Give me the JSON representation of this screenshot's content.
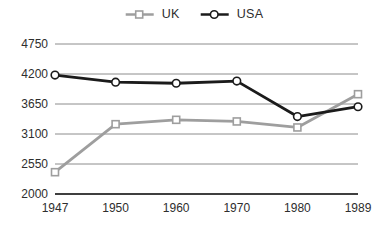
{
  "chart_data": {
    "type": "line",
    "title": "",
    "xlabel": "",
    "ylabel": "",
    "categories": [
      "1947",
      "1950",
      "1960",
      "1970",
      "1980",
      "1989"
    ],
    "series": [
      {
        "name": "UK",
        "color": "#9e9e9e",
        "marker": "square",
        "values": [
          2400,
          3280,
          3360,
          3330,
          3220,
          3830
        ]
      },
      {
        "name": "USA",
        "color": "#1b1b1b",
        "marker": "circle",
        "values": [
          4180,
          4050,
          4030,
          4070,
          3420,
          3600
        ]
      }
    ],
    "ylim": [
      2000,
      4750
    ],
    "yticks": [
      4750,
      4200,
      3650,
      3100,
      2550,
      2000
    ],
    "grid": true,
    "legend_position": "top-center",
    "colors": {
      "gridline": "#8c8c8c",
      "axis_line": "#3f3f3f",
      "tick_text": "#2e2e2e",
      "marker_fill": "#ffffff",
      "background": "#ffffff"
    }
  }
}
